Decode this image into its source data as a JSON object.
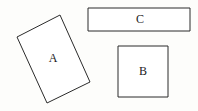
{
  "canvas": {
    "width": 198,
    "height": 111,
    "background_color": "#fdfdfb",
    "stroke_color": "#2b2b2b",
    "fill_color": "#ffffff"
  },
  "shapes": [
    {
      "id": "shape-a",
      "label": "A",
      "kind": "rotated-rectangle",
      "points": "60,15 90,82 47,103 17,37",
      "label_x": 53,
      "label_y": 59
    },
    {
      "id": "shape-b",
      "label": "B",
      "kind": "square",
      "points": "118,46 168,46 168,97 118,97",
      "label_x": 143,
      "label_y": 72
    },
    {
      "id": "shape-c",
      "label": "C",
      "kind": "wide-rectangle",
      "points": "88,8 190,8 190,31 88,31",
      "label_x": 140,
      "label_y": 20
    }
  ]
}
